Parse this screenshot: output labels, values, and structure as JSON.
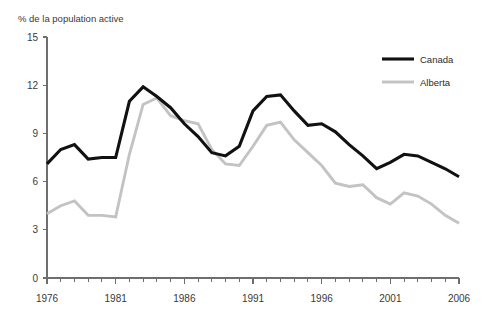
{
  "chart_data": {
    "type": "line",
    "title": "",
    "ylabel": "% de la population active",
    "xlabel": "",
    "xlim": [
      1976,
      2006
    ],
    "ylim": [
      0,
      15
    ],
    "yticks": [
      0,
      3,
      6,
      9,
      12,
      15
    ],
    "ytick_labels": [
      "0",
      "3",
      "6",
      "9",
      "12",
      "15"
    ],
    "xticks": [
      1976,
      1981,
      1986,
      1991,
      1996,
      2001,
      2006
    ],
    "xtick_labels": [
      "1976",
      "1981",
      "1986",
      "1991",
      "1996",
      "2001",
      "2006"
    ],
    "x_minor_tick_step": 1,
    "grid": false,
    "legend_position": "top-right",
    "x": [
      1976,
      1977,
      1978,
      1979,
      1980,
      1981,
      1982,
      1983,
      1984,
      1985,
      1986,
      1987,
      1988,
      1989,
      1990,
      1991,
      1992,
      1993,
      1994,
      1995,
      1996,
      1997,
      1998,
      1999,
      2000,
      2001,
      2002,
      2003,
      2004,
      2005,
      2006
    ],
    "series": [
      {
        "name": "Canada",
        "color": "#111111",
        "values": [
          7.1,
          8.0,
          8.3,
          7.4,
          7.5,
          7.5,
          11.0,
          11.9,
          11.3,
          10.6,
          9.6,
          8.8,
          7.8,
          7.6,
          8.2,
          10.4,
          11.3,
          11.4,
          10.4,
          9.5,
          9.6,
          9.1,
          8.3,
          7.6,
          6.8,
          7.2,
          7.7,
          7.6,
          7.2,
          6.8,
          6.3
        ]
      },
      {
        "name": "Alberta",
        "color": "#c3c3c3",
        "values": [
          4.0,
          4.5,
          4.8,
          3.9,
          3.9,
          3.8,
          7.7,
          10.8,
          11.2,
          10.1,
          9.8,
          9.6,
          8.0,
          7.1,
          7.0,
          8.2,
          9.5,
          9.7,
          8.6,
          7.8,
          7.0,
          5.9,
          5.7,
          5.8,
          5.0,
          4.6,
          5.3,
          5.1,
          4.6,
          3.9,
          3.4
        ]
      }
    ]
  },
  "legend": {
    "items": [
      {
        "label": "Canada"
      },
      {
        "label": "Alberta"
      }
    ]
  }
}
